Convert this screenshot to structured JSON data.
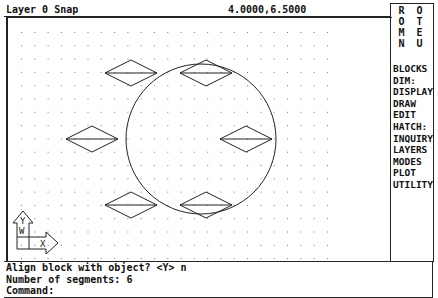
{
  "status_bar": {
    "layer_snap": "Layer 0 Snap",
    "coordinates": "4.0000,6.5000"
  },
  "screen_menu": {
    "title_line1": "R O O T",
    "title_line2": "M E N U",
    "items": [
      "BLOCKS",
      "DIM:",
      "DISPLAY",
      "DRAW",
      "EDIT",
      "HATCH:",
      "INQUIRY",
      "LAYERS",
      "MODES",
      "PLOT",
      "UTILITY"
    ]
  },
  "command_area": {
    "lines": [
      "Align block with object? <Y> n",
      "Number of segments: 6",
      "Command:"
    ]
  },
  "drawing": {
    "grid": {
      "origin_x": 19,
      "origin_y": 31,
      "spacing": 13.3,
      "cols": 24,
      "rows": 18
    },
    "circle": {
      "cx": 199,
      "cy": 138,
      "r": 75
    },
    "blocks": [
      {
        "cx": 129,
        "cy": 72
      },
      {
        "cx": 204,
        "cy": 72
      },
      {
        "cx": 90,
        "cy": 138
      },
      {
        "cx": 244,
        "cy": 138
      },
      {
        "cx": 129,
        "cy": 204
      },
      {
        "cx": 204,
        "cy": 204
      }
    ],
    "ucs_icon": {
      "x_label": "X",
      "y_label": "Y",
      "w_label": "W"
    },
    "colors": {
      "line": "#222222",
      "grid": "#777777"
    }
  }
}
